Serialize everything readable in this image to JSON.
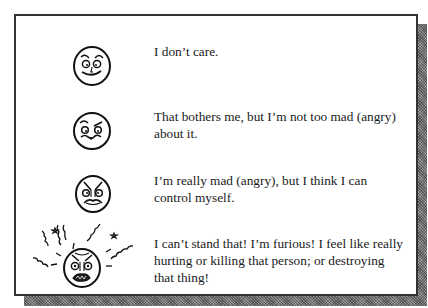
{
  "scale": {
    "items": [
      {
        "level": 1,
        "icon": "calm-face-icon",
        "text": "I don’t care."
      },
      {
        "level": 2,
        "icon": "annoyed-face-icon",
        "text": "That bothers me, but I’m not too mad (angry) about it."
      },
      {
        "level": 3,
        "icon": "angry-face-icon",
        "text": "I’m really mad (angry), but I think I can control myself."
      },
      {
        "level": 4,
        "icon": "furious-face-icon",
        "text": "I can’t stand that! I’m furious! I feel like really hurting or killing that person; or destroying that thing!"
      }
    ]
  },
  "colors": {
    "border": "#333333",
    "shadow": "#7a7a7a",
    "ink": "#1a1a1a"
  }
}
